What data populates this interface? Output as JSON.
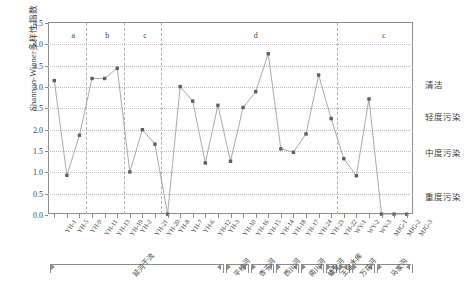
{
  "chart_data": {
    "type": "line",
    "title": "",
    "xlabel": "",
    "ylabel": "Shannon-Wiener多样性指数",
    "ylim": [
      0.0,
      4.5
    ],
    "ytick_labels": [
      "0.0",
      "0.5",
      "1.0",
      "1.5",
      "2.0",
      "2.5",
      "3.0",
      "3.5",
      "4.0",
      "4.5"
    ],
    "ytick_values": [
      0.0,
      0.5,
      1.0,
      1.5,
      2.0,
      2.5,
      3.0,
      3.5,
      4.0,
      4.5
    ],
    "grid": "horizontal-dotted",
    "legend": "none",
    "marker": "filled-square",
    "categories": [
      "YH-1",
      "YH-5",
      "YH-9",
      "YH-11",
      "YH-13",
      "YH-19",
      "YH-2",
      "YH-21",
      "YH-20",
      "YH-8",
      "YH-7",
      "YH-6",
      "YH-12",
      "YH-3",
      "YH-10",
      "YH-16",
      "YH-15",
      "YH-14",
      "YH-18",
      "YH-17",
      "YH-24",
      "YH-23",
      "YH-22",
      "WY-1",
      "WY-2",
      "WY-3",
      "MJG-1",
      "MJG-2",
      "MJG-3"
    ],
    "values": [
      3.15,
      0.93,
      1.87,
      3.2,
      3.2,
      3.44,
      1.01,
      2.0,
      1.66,
      0.02,
      3.01,
      2.67,
      1.22,
      2.57,
      1.26,
      2.52,
      2.89,
      3.78,
      1.55,
      1.47,
      1.9,
      3.28,
      2.26,
      1.32,
      0.92,
      2.72,
      0.02,
      0.02,
      0.02
    ],
    "zone_labels": [
      {
        "text": "a",
        "at_index": 1.5
      },
      {
        "text": "b",
        "at_index": 4.2
      },
      {
        "text": "c",
        "at_index": 7.2
      },
      {
        "text": "d",
        "at_index": 16.0
      },
      {
        "text": "c",
        "at_index": 26.2
      }
    ],
    "separators_after_index": [
      2,
      5,
      8,
      22
    ],
    "right_annotations": [
      {
        "label": "清洁",
        "value": 3.05
      },
      {
        "label": "轻度污染",
        "value": 2.3
      },
      {
        "label": "中度污染",
        "value": 1.45
      },
      {
        "label": "重度污染",
        "value": 0.42
      }
    ],
    "groups": [
      {
        "label": "延河干流",
        "start_index": 0,
        "end_index": 13
      },
      {
        "label": "平桥河",
        "start_index": 14,
        "end_index": 15
      },
      {
        "label": "杏子河",
        "start_index": 16,
        "end_index": 17
      },
      {
        "label": "西川河",
        "start_index": 18,
        "end_index": 19
      },
      {
        "label": "南川河",
        "start_index": 20,
        "end_index": 21
      },
      {
        "label": "蟠龙河",
        "start_index": 22,
        "end_index": 22
      },
      {
        "label": "王瑶水库",
        "start_index": 23,
        "end_index": 23
      },
      {
        "label": "万花河",
        "start_index": 24,
        "end_index": 25
      },
      {
        "label": "马家沟",
        "start_index": 26,
        "end_index": 28
      }
    ]
  }
}
